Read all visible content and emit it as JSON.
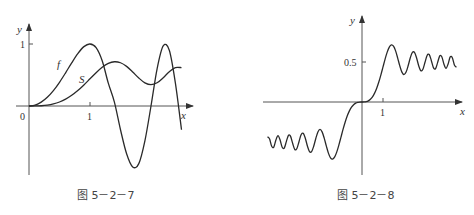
{
  "figures": [
    {
      "caption": "图 5－2－7",
      "y_axis_label": "y",
      "x_axis_label": "x",
      "origin_label": "0",
      "x_tick_label": "1",
      "y_tick_label": "1",
      "curve_labels": [
        "f",
        "S"
      ]
    },
    {
      "caption": "图 5－2－8",
      "y_axis_label": "y",
      "x_axis_label": "x",
      "x_tick_label": "1",
      "y_tick_label": "0.5"
    }
  ],
  "chart_data": [
    {
      "type": "line",
      "title": "图 5－2－7",
      "xlabel": "x",
      "ylabel": "y",
      "x_ticks": [
        0,
        1
      ],
      "y_ticks": [
        1
      ],
      "xlim": [
        -0.2,
        2.7
      ],
      "ylim": [
        -1.1,
        1.25
      ],
      "grid": false,
      "legend": "inline labels f and S",
      "x": [
        0,
        0.1,
        0.2,
        0.3,
        0.4,
        0.5,
        0.6,
        0.7,
        0.8,
        0.9,
        1.0,
        1.1,
        1.2,
        1.3,
        1.4,
        1.5,
        1.6,
        1.7,
        1.8,
        1.9,
        2.0,
        2.1,
        2.2,
        2.3,
        2.4,
        2.5
      ],
      "series": [
        {
          "name": "f",
          "values": [
            0,
            0.0157,
            0.0628,
            0.1409,
            0.2487,
            0.3827,
            0.5358,
            0.6959,
            0.8443,
            0.9576,
            1.0,
            0.9409,
            0.729,
            0.3681,
            0.0628,
            -0.3827,
            -0.7705,
            -0.9823,
            -0.9298,
            -0.5621,
            0,
            0.6004,
            0.9686,
            0.898,
            0.3681,
            -0.3827
          ]
        },
        {
          "name": "S",
          "values": [
            0,
            0.0005,
            0.0042,
            0.0141,
            0.0334,
            0.0647,
            0.1105,
            0.1721,
            0.2493,
            0.3398,
            0.4383,
            0.5365,
            0.6234,
            0.6863,
            0.7135,
            0.6975,
            0.6389,
            0.5492,
            0.4509,
            0.3733,
            0.3434,
            0.3743,
            0.4557,
            0.5532,
            0.6197,
            0.6192
          ]
        }
      ]
    },
    {
      "type": "line",
      "title": "图 5－2－8",
      "xlabel": "x",
      "ylabel": "y",
      "x_ticks": [
        1
      ],
      "y_ticks": [
        0.5
      ],
      "xlim": [
        -4.7,
        4.8
      ],
      "ylim": [
        -0.9,
        1.05
      ],
      "grid": false,
      "x": [
        0,
        0.1,
        0.2,
        0.3,
        0.4,
        0.5,
        0.6,
        0.7,
        0.8,
        0.9,
        1.0,
        1.1,
        1.2,
        1.3,
        1.4,
        1.5,
        1.6,
        1.7,
        1.8,
        1.9,
        2.0,
        2.1,
        2.2,
        2.3,
        2.4,
        2.5,
        2.6,
        2.7,
        2.8,
        2.9,
        3.0,
        3.1,
        3.2,
        3.3,
        3.4,
        3.5,
        3.6,
        3.7,
        3.8,
        3.9,
        4.0,
        4.1,
        4.2,
        4.3,
        4.4,
        4.5
      ],
      "series": [
        {
          "name": "S (odd function, S(-x) = -S(x))",
          "values": [
            0,
            0.0005,
            0.0042,
            0.0141,
            0.0334,
            0.0647,
            0.1105,
            0.1721,
            0.2493,
            0.3398,
            0.4383,
            0.5365,
            0.6234,
            0.6863,
            0.7135,
            0.6975,
            0.6389,
            0.5492,
            0.4509,
            0.3733,
            0.3434,
            0.3743,
            0.4557,
            0.5532,
            0.6197,
            0.6192,
            0.55,
            0.4529,
            0.3915,
            0.4101,
            0.4963,
            0.5818,
            0.5933,
            0.5193,
            0.4296,
            0.4152,
            0.4923,
            0.575,
            0.5656,
            0.4752,
            0.4205,
            0.4758,
            0.5632,
            0.554,
            0.4623,
            0.4342
          ]
        }
      ]
    }
  ]
}
